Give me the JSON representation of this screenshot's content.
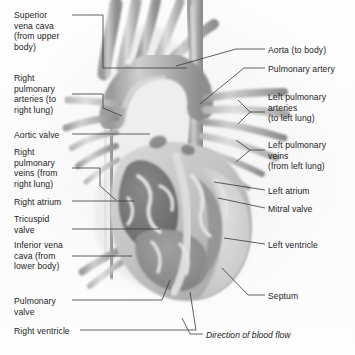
{
  "figure": {
    "style": "grayscale pencil/airbrush medical illustration",
    "background_color": "#fdfdfd",
    "text_color": "#1c1c1c",
    "leader_line_color": "#3a3a3a"
  },
  "labels_left": [
    {
      "id": "superior-vena-cava",
      "text": "Superior\nvena cava\n(from upper\nbody)",
      "x": 14,
      "y": 10
    },
    {
      "id": "right-pulmonary-arteries",
      "text": "Right\npulmonary\narteries (to\nright lung)",
      "x": 14,
      "y": 73
    },
    {
      "id": "aortic-valve",
      "text": "Aortic valve",
      "x": 14,
      "y": 130
    },
    {
      "id": "right-pulmonary-veins",
      "text": "Right\npulmonary\nveins (from\nright lung)",
      "x": 14,
      "y": 147
    },
    {
      "id": "right-atrium",
      "text": "Right atrium",
      "x": 14,
      "y": 197
    },
    {
      "id": "tricuspid-valve",
      "text": "Tricuspid\nvalve",
      "x": 14,
      "y": 214
    },
    {
      "id": "inferior-vena-cava",
      "text": "Inferior vena\ncava (from\nlower body)",
      "x": 14,
      "y": 240
    },
    {
      "id": "pulmonary-valve",
      "text": "Pulmonary\nvalve",
      "x": 14,
      "y": 296
    },
    {
      "id": "right-ventricle",
      "text": "Right ventricle",
      "x": 14,
      "y": 326
    }
  ],
  "labels_right": [
    {
      "id": "aorta",
      "text": "Aorta (to body)",
      "x": 268,
      "y": 45
    },
    {
      "id": "pulmonary-artery",
      "text": "Pulmonary artery",
      "x": 268,
      "y": 64
    },
    {
      "id": "left-pulmonary-arteries",
      "text": "Left pulmonary\narteries\n(to left lung)",
      "x": 268,
      "y": 92
    },
    {
      "id": "left-pulmonary-veins",
      "text": "Left pulmonary\nveins\n(from left lung)",
      "x": 268,
      "y": 140
    },
    {
      "id": "left-atrium",
      "text": "Left atrium",
      "x": 268,
      "y": 186
    },
    {
      "id": "mitral-valve",
      "text": "Mitral valve",
      "x": 268,
      "y": 204
    },
    {
      "id": "left-ventricle",
      "text": "Left ventricle",
      "x": 268,
      "y": 240
    },
    {
      "id": "septum",
      "text": "Septum",
      "x": 268,
      "y": 291
    }
  ],
  "caption": {
    "id": "direction-of-blood-flow",
    "text": "Direction of blood flow",
    "x": 206,
    "y": 330
  }
}
